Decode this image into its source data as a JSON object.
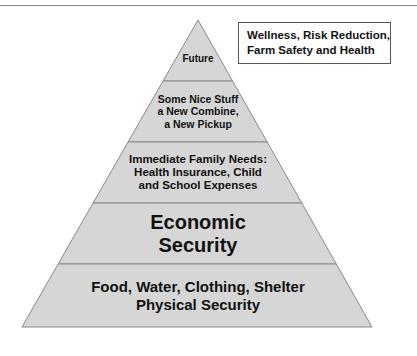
{
  "diagram": {
    "type": "pyramid",
    "fill_color": "#d6d6d6",
    "edge_color": "#8a8a8a",
    "levels_top_to_bottom": [
      {
        "id": "future",
        "label": "Future"
      },
      {
        "id": "nice-stuff",
        "label": "Some Nice Stuff\na New Combine,\na New Pickup"
      },
      {
        "id": "family-needs",
        "label": "Immediate Family Needs:\nHealth Insurance, Child\nand School Expenses"
      },
      {
        "id": "economic-security",
        "label": "Economic\nSecurity"
      },
      {
        "id": "physical-security",
        "label": "Food, Water, Clothing, Shelter\nPhysical Security"
      }
    ],
    "callout": "Wellness, Risk Reduction,\nFarm Safety and Health"
  }
}
